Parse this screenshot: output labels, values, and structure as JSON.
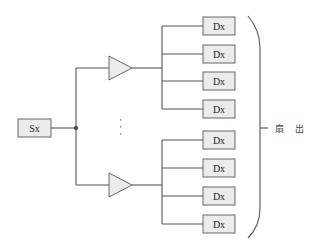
{
  "diagram": {
    "source": {
      "label": "Sx"
    },
    "buffers": [
      {
        "name": "upper-buffer"
      },
      {
        "name": "lower-buffer"
      }
    ],
    "destinations": [
      {
        "label": "Dx",
        "group": 0
      },
      {
        "label": "Dx",
        "group": 0
      },
      {
        "label": "Dx",
        "group": 0
      },
      {
        "label": "Dx",
        "group": 0
      },
      {
        "label": "Dx",
        "group": 1
      },
      {
        "label": "Dx",
        "group": 1
      },
      {
        "label": "Dx",
        "group": 1
      },
      {
        "label": "Dx",
        "group": 1
      }
    ],
    "ellipsis": "⋮",
    "brace_label": "扇 出"
  }
}
